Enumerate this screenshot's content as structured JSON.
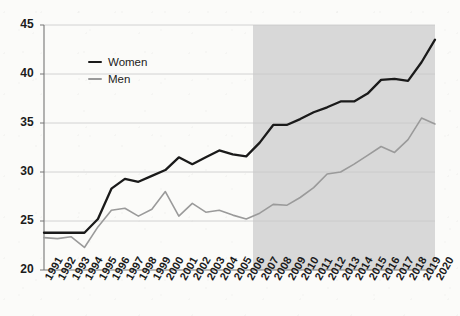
{
  "chart_data": {
    "type": "line",
    "title": "",
    "xlabel": "",
    "ylabel": "",
    "x": [
      1991,
      1992,
      1993,
      1994,
      1995,
      1996,
      1997,
      1998,
      1999,
      2000,
      2001,
      2002,
      2003,
      2004,
      2005,
      2006,
      2007,
      2008,
      2009,
      2010,
      2011,
      2012,
      2013,
      2014,
      2015,
      2016,
      2017,
      2018,
      2019,
      2020
    ],
    "xtick_labels": [
      "1991",
      "1992",
      "1993",
      "1994",
      "1995",
      "1996",
      "1997",
      "1998",
      "1999",
      "2000",
      "2001",
      "2002",
      "2003",
      "2004",
      "2005",
      "2006",
      "2007",
      "2008",
      "2009",
      "2010",
      "2011",
      "2012",
      "2013",
      "2014",
      "2015",
      "2016",
      "2017",
      "2018",
      "2019",
      "2020"
    ],
    "ytick_labels": [
      "20",
      "25",
      "30",
      "35",
      "40",
      "45"
    ],
    "yticks": [
      20,
      25,
      30,
      35,
      40,
      45
    ],
    "ylim": [
      20,
      45
    ],
    "xlim": [
      1991,
      2020
    ],
    "grid": "horizontal",
    "legend_position": "upper-left-inside",
    "series": [
      {
        "name": "Women",
        "color": "#1a1a1a",
        "width": 2.3,
        "values": [
          23.8,
          23.8,
          23.8,
          23.8,
          25.2,
          28.3,
          29.3,
          29.0,
          29.6,
          30.2,
          31.5,
          30.8,
          31.5,
          32.2,
          31.8,
          31.6,
          33.0,
          34.8,
          34.8,
          35.4,
          36.1,
          36.6,
          37.2,
          37.2,
          38.0,
          39.4,
          39.5,
          39.3,
          41.2,
          43.5
        ]
      },
      {
        "name": "Men",
        "color": "#9a9a9a",
        "width": 1.6,
        "values": [
          23.3,
          23.2,
          23.4,
          22.3,
          24.4,
          26.1,
          26.3,
          25.5,
          26.2,
          28.0,
          25.5,
          26.8,
          25.9,
          26.1,
          25.6,
          25.2,
          25.8,
          26.7,
          26.6,
          27.4,
          28.4,
          29.8,
          30.0,
          30.8,
          31.7,
          32.6,
          32.0,
          33.3,
          35.5,
          34.9
        ]
      }
    ],
    "shaded_region": {
      "from": 2007,
      "to": 2020,
      "color": "#d8d8d8",
      "label": ""
    },
    "plot_bg": "#fbfbf9",
    "axis_color": "#767676",
    "grid_color": "#c9c9c9"
  },
  "legend": {
    "items": [
      {
        "label": "Women"
      },
      {
        "label": "Men"
      }
    ]
  }
}
